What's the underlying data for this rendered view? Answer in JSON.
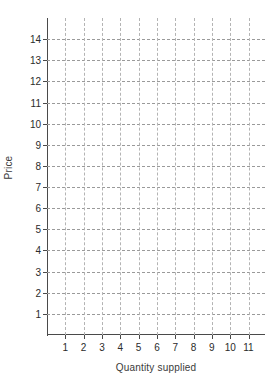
{
  "chart_data": {
    "type": "scatter",
    "title": "",
    "subtitle": "",
    "xlabel": "Quantity supplied",
    "ylabel": "Price",
    "x_tick_labels": [
      "1",
      "2",
      "3",
      "4",
      "5",
      "6",
      "7",
      "8",
      "9",
      "10",
      "11"
    ],
    "x_ticks": [
      1,
      2,
      3,
      4,
      5,
      6,
      7,
      8,
      9,
      10,
      11
    ],
    "y_tick_labels": [
      "1",
      "2",
      "3",
      "4",
      "5",
      "6",
      "7",
      "8",
      "9",
      "10",
      "11",
      "12",
      "13",
      "14"
    ],
    "y_ticks": [
      1,
      2,
      3,
      4,
      5,
      6,
      7,
      8,
      9,
      10,
      11,
      12,
      13,
      14
    ],
    "xlim": [
      0,
      11.9
    ],
    "ylim": [
      0,
      15.0
    ],
    "grid": true,
    "grid_style": "dashed",
    "legend": false,
    "legend_position": "none",
    "series": [],
    "annotations": [],
    "note": "Empty grid template: axes, ticks and dashed gridlines only, no plotted data",
    "colors": {
      "axis": "#4a4a4a",
      "grid_horizontal": "#9a9a9a",
      "grid_vertical": "#b4b4b4",
      "text": "#2b2b2b",
      "background": "#ffffff"
    }
  }
}
